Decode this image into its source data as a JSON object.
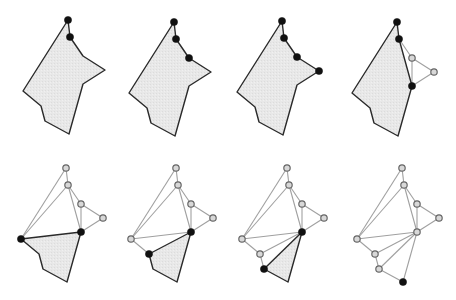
{
  "colors": {
    "background": "#ffffff",
    "fill": "#e6e6e6",
    "outline": "#2a2a2a",
    "diagonal": "#a0a0a0",
    "node_filled": "#111111",
    "node_hollow_fill": "#d8d8d8",
    "node_hollow_stroke": "#666666"
  },
  "polygon_template": {
    "vertex_names": [
      "top",
      "v2",
      "v3",
      "tip",
      "v5",
      "bottom",
      "v7",
      "v8",
      "left"
    ],
    "offsets": [
      [
        0,
        0
      ],
      [
        2,
        17
      ],
      [
        15,
        36
      ],
      [
        37,
        50
      ],
      [
        15,
        64
      ],
      [
        1,
        114
      ],
      [
        -23,
        101
      ],
      [
        -27,
        86
      ],
      [
        -45,
        71
      ]
    ]
  },
  "panels": [
    {
      "id": "step-1",
      "origin": [
        68,
        20
      ],
      "fill_poly": [
        0,
        1,
        2,
        3,
        4,
        5,
        6,
        7,
        8
      ],
      "outline": [
        0,
        1,
        2,
        3,
        4,
        5,
        6,
        7,
        8
      ],
      "diagonals": [],
      "filled_nodes": [
        0,
        1
      ],
      "hollow_nodes": []
    },
    {
      "id": "step-2",
      "origin": [
        174,
        22
      ],
      "fill_poly": [
        0,
        1,
        2,
        3,
        4,
        5,
        6,
        7,
        8
      ],
      "outline": [
        0,
        1,
        2,
        3,
        4,
        5,
        6,
        7,
        8
      ],
      "diagonals": [],
      "filled_nodes": [
        0,
        1,
        2
      ],
      "hollow_nodes": []
    },
    {
      "id": "step-3",
      "origin": [
        282,
        21
      ],
      "fill_poly": [
        0,
        1,
        2,
        3,
        4,
        5,
        6,
        7,
        8
      ],
      "outline": [
        0,
        1,
        2,
        3,
        4,
        5,
        6,
        7,
        8
      ],
      "diagonals": [],
      "filled_nodes": [
        0,
        1,
        2,
        3
      ],
      "hollow_nodes": []
    },
    {
      "id": "step-4",
      "origin": [
        397,
        22
      ],
      "fill_poly": [
        0,
        1,
        4,
        5,
        6,
        7,
        8
      ],
      "outline": [
        0,
        1,
        4,
        5,
        6,
        7,
        8
      ],
      "diagonals": [
        [
          1,
          2
        ],
        [
          2,
          3
        ],
        [
          3,
          4
        ],
        [
          2,
          4
        ]
      ],
      "filled_nodes": [
        0,
        1,
        4
      ],
      "hollow_nodes": [
        2,
        3
      ]
    },
    {
      "id": "step-5",
      "origin": [
        66,
        168
      ],
      "fill_poly": [
        8,
        4,
        5,
        6,
        7
      ],
      "outline": [
        8,
        4,
        5,
        6,
        7
      ],
      "diagonals": [
        [
          0,
          1
        ],
        [
          1,
          2
        ],
        [
          2,
          3
        ],
        [
          3,
          4
        ],
        [
          2,
          4
        ],
        [
          0,
          8
        ],
        [
          1,
          8
        ],
        [
          1,
          4
        ]
      ],
      "filled_nodes": [
        8,
        4
      ],
      "hollow_nodes": [
        0,
        1,
        2,
        3
      ]
    },
    {
      "id": "step-6",
      "origin": [
        176,
        168
      ],
      "fill_poly": [
        7,
        4,
        5,
        6
      ],
      "outline": [
        7,
        4,
        5,
        6
      ],
      "diagonals": [
        [
          0,
          1
        ],
        [
          1,
          2
        ],
        [
          2,
          3
        ],
        [
          3,
          4
        ],
        [
          2,
          4
        ],
        [
          0,
          8
        ],
        [
          1,
          8
        ],
        [
          1,
          4
        ],
        [
          8,
          4
        ],
        [
          8,
          7
        ]
      ],
      "filled_nodes": [
        7,
        4
      ],
      "hollow_nodes": [
        0,
        1,
        2,
        3,
        8
      ]
    },
    {
      "id": "step-7",
      "origin": [
        287,
        168
      ],
      "fill_poly": [
        6,
        4,
        5
      ],
      "outline": [
        6,
        4,
        5
      ],
      "diagonals": [
        [
          0,
          1
        ],
        [
          1,
          2
        ],
        [
          2,
          3
        ],
        [
          3,
          4
        ],
        [
          2,
          4
        ],
        [
          0,
          8
        ],
        [
          1,
          8
        ],
        [
          1,
          4
        ],
        [
          8,
          4
        ],
        [
          8,
          7
        ],
        [
          7,
          4
        ],
        [
          7,
          6
        ]
      ],
      "filled_nodes": [
        6,
        4
      ],
      "hollow_nodes": [
        0,
        1,
        2,
        3,
        7,
        8
      ]
    },
    {
      "id": "step-8",
      "origin": [
        402,
        168
      ],
      "fill_poly": [],
      "outline": [],
      "diagonals": [
        [
          0,
          1
        ],
        [
          1,
          2
        ],
        [
          2,
          3
        ],
        [
          3,
          4
        ],
        [
          2,
          4
        ],
        [
          0,
          8
        ],
        [
          1,
          8
        ],
        [
          1,
          4
        ],
        [
          8,
          4
        ],
        [
          8,
          7
        ],
        [
          7,
          4
        ],
        [
          7,
          6
        ],
        [
          6,
          4
        ],
        [
          6,
          5
        ],
        [
          4,
          5
        ]
      ],
      "filled_nodes": [
        5
      ],
      "hollow_nodes": [
        0,
        1,
        2,
        3,
        4,
        6,
        7,
        8
      ]
    }
  ]
}
